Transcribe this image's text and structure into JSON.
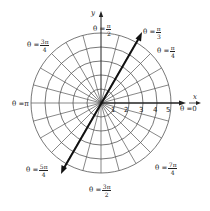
{
  "diagram": {
    "type": "polar-coordinate-grid",
    "center": {
      "x": 101,
      "y": 103
    },
    "unit_radius_px": 14,
    "circles": [
      1,
      2,
      3,
      4,
      5
    ],
    "radial_line_step": "pi/12",
    "highlighted_ray": {
      "angle_label": "θ = π/3",
      "angle_deg": 60,
      "bidirectional": true
    },
    "axes": {
      "x_label": "x",
      "y_label": "y"
    },
    "tick_labels": [
      "1",
      "2",
      "3",
      "4",
      "5"
    ],
    "angle_labels": [
      {
        "id": "theta-0",
        "prefix": "θ = ",
        "value": "0",
        "num": "",
        "den": ""
      },
      {
        "id": "theta-pi-over-4",
        "prefix": "θ = ",
        "value": "",
        "num": "π",
        "den": "4"
      },
      {
        "id": "theta-pi-over-3",
        "prefix": "θ = ",
        "value": "",
        "num": "π",
        "den": "3"
      },
      {
        "id": "theta-pi-over-2",
        "prefix": "θ = ",
        "value": "",
        "num": "π",
        "den": "2"
      },
      {
        "id": "theta-3pi-over-4",
        "prefix": "θ = ",
        "value": "",
        "num": "3π",
        "den": "4"
      },
      {
        "id": "theta-pi",
        "prefix": "θ = ",
        "value": "π",
        "num": "",
        "den": ""
      },
      {
        "id": "theta-5pi-over-4",
        "prefix": "θ = ",
        "value": "",
        "num": "5π",
        "den": "4"
      },
      {
        "id": "theta-3pi-over-2",
        "prefix": "θ = ",
        "value": "",
        "num": "3π",
        "den": "2"
      },
      {
        "id": "theta-7pi-over-4",
        "prefix": "θ = ",
        "value": "",
        "num": "7π",
        "den": "4"
      }
    ],
    "colors": {
      "grid": "#555555",
      "axis": "#222222",
      "ray": "#222222",
      "background": "#ffffff"
    }
  }
}
